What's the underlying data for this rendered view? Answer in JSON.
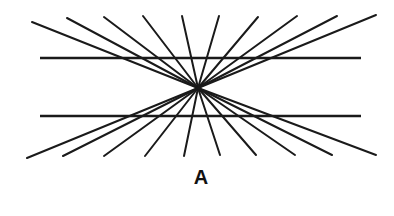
{
  "figure": {
    "label": "A",
    "center": [
      198,
      88
    ],
    "stroke_color": "#1a1a1a",
    "background": "#ffffff",
    "horizontal_lines": [
      {
        "x1": 40,
        "y1": 58,
        "x2": 361,
        "y2": 58
      },
      {
        "x1": 40,
        "y1": 116,
        "x2": 361,
        "y2": 116
      }
    ],
    "ray_endpoints": [
      [
        32,
        22
      ],
      [
        67,
        18
      ],
      [
        104,
        17
      ],
      [
        143,
        16
      ],
      [
        182,
        16
      ],
      [
        219,
        16
      ],
      [
        258,
        17
      ],
      [
        297,
        16
      ],
      [
        337,
        16
      ],
      [
        376,
        15
      ],
      [
        27,
        158
      ],
      [
        63,
        156
      ],
      [
        104,
        156
      ],
      [
        145,
        156
      ],
      [
        184,
        156
      ],
      [
        220,
        155
      ],
      [
        256,
        155
      ],
      [
        295,
        155
      ],
      [
        332,
        155
      ],
      [
        376,
        155
      ]
    ]
  }
}
